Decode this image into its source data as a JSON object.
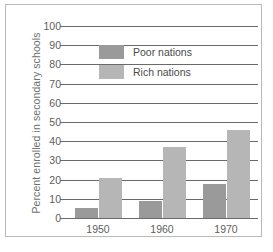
{
  "chart_data": {
    "type": "bar",
    "title": "",
    "xlabel": "",
    "ylabel": "Percent enrolled in secondary schools",
    "categories": [
      "1950",
      "1960",
      "1970"
    ],
    "series": [
      {
        "name": "Poor nations",
        "color": "#9a9a9a",
        "values": [
          5,
          9,
          17.5
        ]
      },
      {
        "name": "Rich nations",
        "color": "#b6b6b6",
        "values": [
          21,
          37,
          46
        ]
      }
    ],
    "ylim": [
      0,
      100
    ],
    "ytick_labels": [
      "0",
      "10",
      "20",
      "30",
      "40",
      "50",
      "60",
      "70",
      "80",
      "90",
      "100"
    ],
    "ytick_values": [
      0,
      10,
      20,
      30,
      40,
      50,
      60,
      70,
      80,
      90,
      100
    ],
    "grid": "horizontal",
    "legend_position": "upper-left-inside"
  },
  "legend": {
    "items": [
      {
        "label": "Poor nations",
        "color": "#9a9a9a"
      },
      {
        "label": "Rich nations",
        "color": "#b6b6b6"
      }
    ]
  },
  "caption": {
    "text": ""
  }
}
